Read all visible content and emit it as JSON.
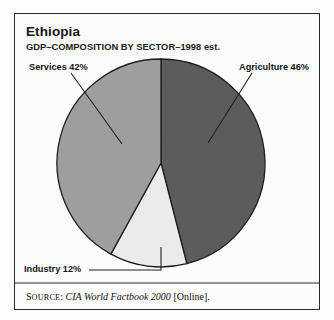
{
  "chart_data": {
    "type": "pie",
    "title": "Ethiopia",
    "subtitle": "GDP–COMPOSITION BY SECTOR–1998 est.",
    "categories": [
      "Agriculture",
      "Industry",
      "Services"
    ],
    "values": [
      46,
      12,
      42
    ],
    "labels": [
      "Agriculture 46%",
      "Industry 12%",
      "Services 42%"
    ],
    "colors": [
      "#5c5c5c",
      "#ebebeb",
      "#9e9e9e"
    ],
    "units": "percent",
    "legend": "none",
    "xlabel": "",
    "ylabel": "",
    "grid": false,
    "slices": [
      {
        "name": "Agriculture",
        "value": 46,
        "label": "Agriculture 46%",
        "color": "#5c5c5c",
        "start_deg": 0,
        "end_deg": 165.6
      },
      {
        "name": "Industry",
        "value": 12,
        "label": "Industry 12%",
        "color": "#ebebeb",
        "start_deg": 165.6,
        "end_deg": 208.8
      },
      {
        "name": "Services",
        "value": 42,
        "label": "Services 42%",
        "color": "#9e9e9e",
        "start_deg": 208.8,
        "end_deg": 360
      }
    ]
  },
  "header": {
    "title": "Ethiopia",
    "subtitle": "GDP–COMPOSITION BY SECTOR–1998 est."
  },
  "labels": {
    "services": "Services 42%",
    "agriculture": "Agriculture 46%",
    "industry": "Industry 12%"
  },
  "source": {
    "prefix": "S",
    "prefix_rest": "OURCE",
    "colon": ":",
    "work": "CIA World Factbook 2000",
    "suffix": "[Online]."
  },
  "colors": {
    "agriculture": "#5c5c5c",
    "industry": "#ebebeb",
    "services": "#9e9e9e",
    "outline": "#1f1f1f",
    "frame": "#2a2a2a",
    "page": "#fdfdfd"
  }
}
